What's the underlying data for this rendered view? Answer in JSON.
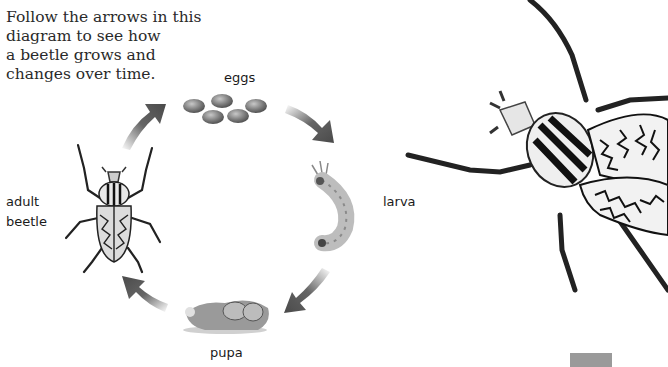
{
  "intro_text": {
    "lines": [
      "Follow the arrows in this",
      "diagram to see how",
      "a beetle grows and",
      "changes over time."
    ]
  },
  "stages": {
    "eggs": "eggs",
    "larva": "larva",
    "pupa": "pupa",
    "adult_line1": "adult",
    "adult_line2": "beetle"
  },
  "colors": {
    "arrow": "#4a4a4a",
    "text": "#1a1a1a",
    "egg": "#7a7a7a",
    "footer_bar": "#9a9a9a"
  }
}
